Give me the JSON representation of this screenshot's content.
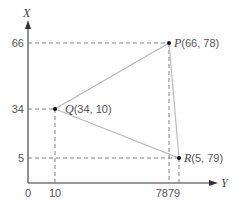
{
  "diagram": {
    "axes": {
      "vertical_label": "X",
      "horizontal_label": "Y",
      "origin_label": "0",
      "vertical_ticks": [
        "66",
        "34",
        "5"
      ],
      "horizontal_ticks": [
        "10",
        "78",
        "79"
      ]
    },
    "points": [
      {
        "name": "P",
        "coords": "(66, 78)",
        "x": 66,
        "y": 78
      },
      {
        "name": "Q",
        "coords": "(34, 10)",
        "x": 34,
        "y": 10
      },
      {
        "name": "R",
        "coords": "(5, 79)",
        "x": 5,
        "y": 79
      }
    ],
    "colors": {
      "axis": "#555555",
      "triangle": "#bbbbbb",
      "dashed": "#777777",
      "point": "#111111"
    }
  }
}
